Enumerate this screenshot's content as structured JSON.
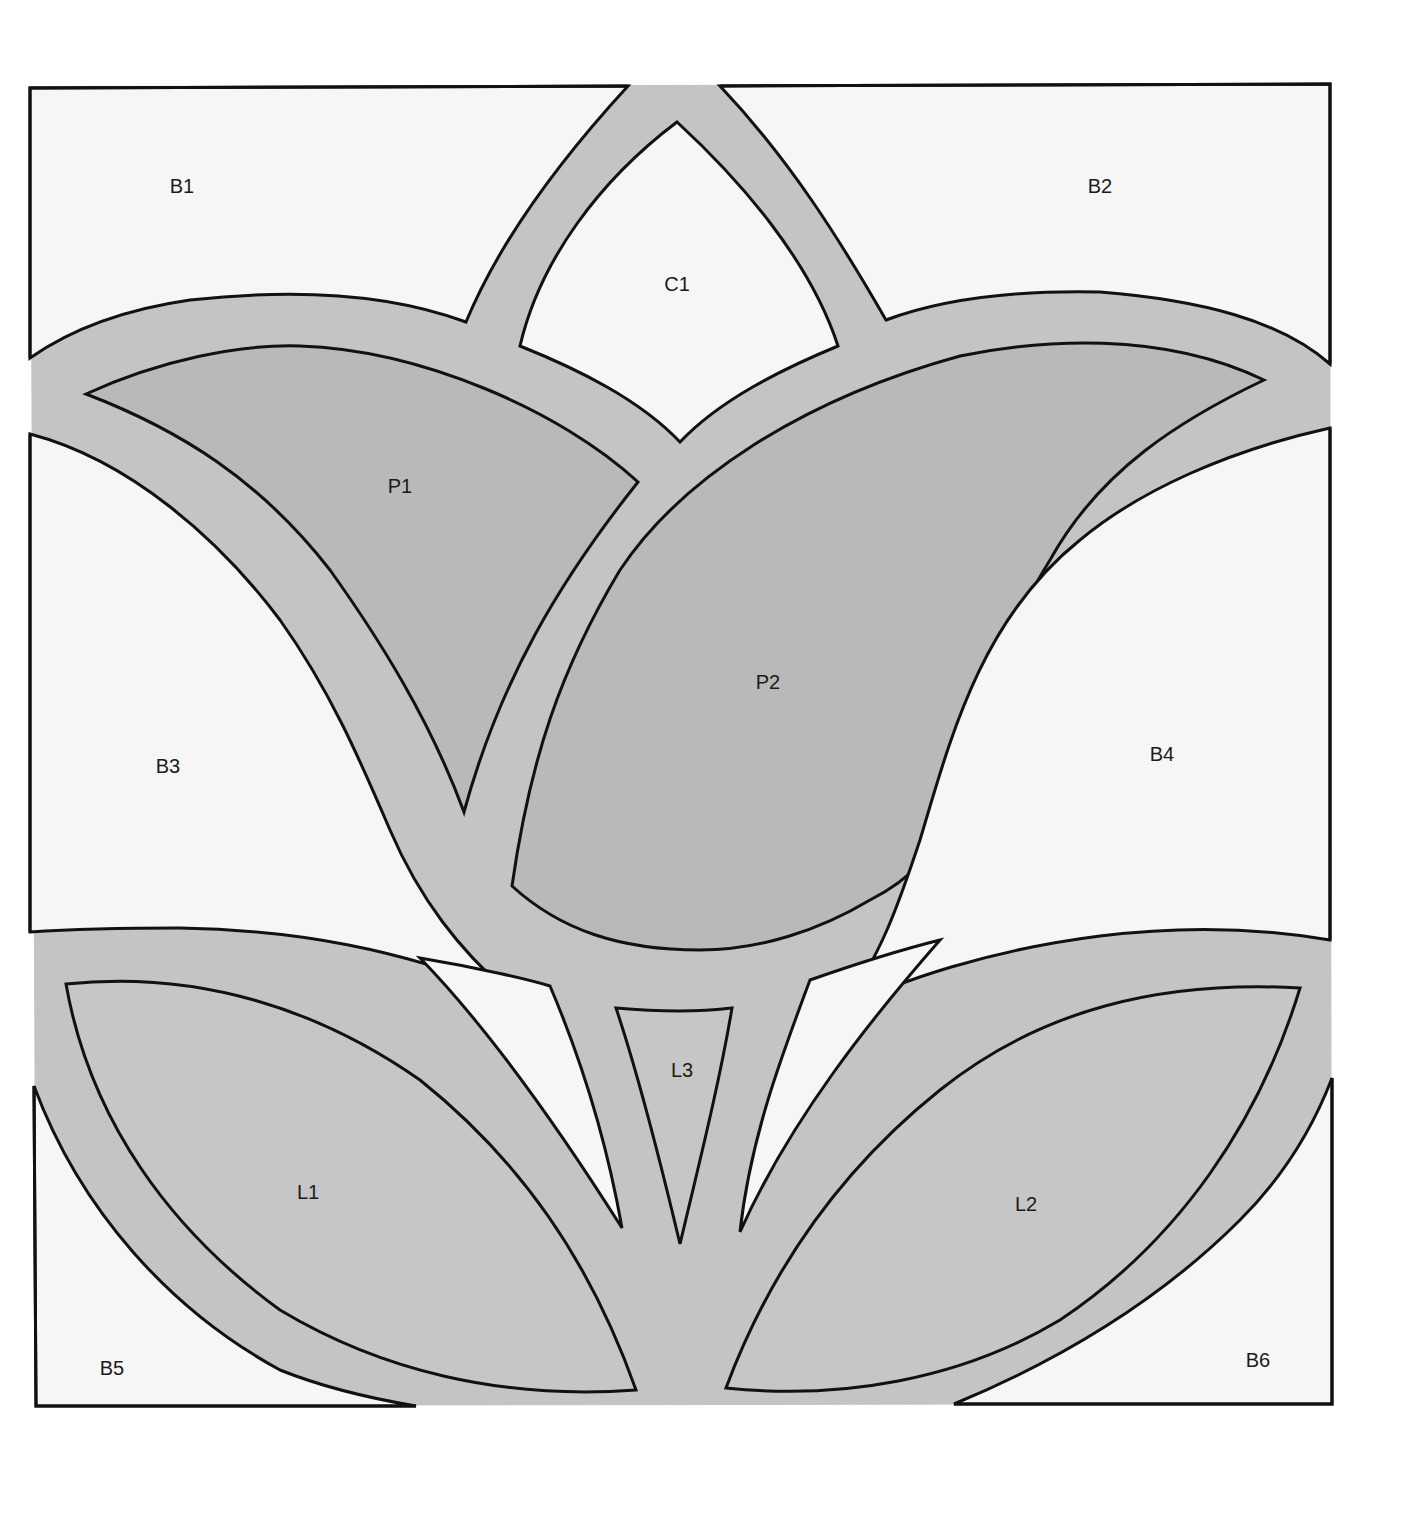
{
  "pattern": {
    "type": "stained-glass tulip block pattern",
    "colors": {
      "page": "#ffffff",
      "lead": "#c4c4c4",
      "background_piece": "#f6f6f6",
      "petal": "#b9b9b9",
      "leaf": "#c6c6c6",
      "outline": "#111111"
    },
    "labels": {
      "B1": "B1",
      "B2": "B2",
      "B3": "B3",
      "B4": "B4",
      "B5": "B5",
      "B6": "B6",
      "C1": "C1",
      "P1": "P1",
      "P2": "P2",
      "L1": "L1",
      "L2": "L2",
      "L3": "L3"
    }
  }
}
